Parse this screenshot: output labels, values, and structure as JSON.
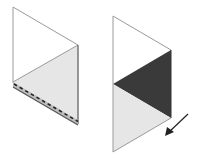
{
  "diagram": {
    "colors": {
      "outline": "#8a8a8a",
      "light_fill": "#e6e6e6",
      "dark_fill": "#3a3a3a",
      "edge_dark": "#555555",
      "dash": "#222222",
      "arrow": "#222222",
      "background": "#ffffff"
    },
    "figures": [
      {
        "id": "left-panel",
        "top_left": [
          13,
          7
        ],
        "top_right": [
          78,
          45
        ],
        "bottom_left": [
          13,
          82
        ],
        "bottom_right": [
          78,
          120
        ],
        "fold_line": "dashed",
        "shaded_region": "lower triangle (light)"
      },
      {
        "id": "right-panel",
        "top_left": [
          113,
          16
        ],
        "top_right": [
          171,
          50
        ],
        "mid_left": [
          113,
          84
        ],
        "bottom_right": [
          171,
          118
        ],
        "bottom_left": [
          113,
          152
        ],
        "shaded_regions": [
          "middle triangle (dark)",
          "bottom triangle (light)"
        ]
      }
    ],
    "arrow": {
      "from": [
        188,
        114
      ],
      "to": [
        165,
        136
      ],
      "direction": "down-left"
    }
  }
}
